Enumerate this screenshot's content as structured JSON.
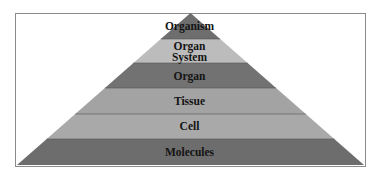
{
  "diagram": {
    "type": "pyramid",
    "direction": "top-to-bottom",
    "levels": [
      {
        "label": "Organism",
        "line1": "Organism",
        "line2": "",
        "color": "#6e6e6e"
      },
      {
        "label": "Organ System",
        "line1": "Organ",
        "line2": "System",
        "color": "#bcbcbc"
      },
      {
        "label": "Organ",
        "line1": "Organ",
        "line2": "",
        "color": "#727272"
      },
      {
        "label": "Tissue",
        "line1": "Tissue",
        "line2": "",
        "color": "#a3a3a3"
      },
      {
        "label": "Cell",
        "line1": "Cell",
        "line2": "",
        "color": "#a9a9a9"
      },
      {
        "label": "Molecules",
        "line1": "Molecules",
        "line2": "",
        "color": "#6d6d6d"
      }
    ]
  }
}
